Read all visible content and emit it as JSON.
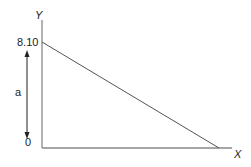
{
  "diagram": {
    "y_axis_label": "Y",
    "x_axis_label": "X",
    "y_top_value": "8.10",
    "y_zero_value": "0",
    "arrow_label": "a",
    "line": {
      "from": {
        "x": 0,
        "y": 8.1
      },
      "to": {
        "x": "x-intercept",
        "y": 0
      }
    },
    "colors": {
      "axis": "#888888",
      "line": "#555555",
      "text": "#222222"
    }
  }
}
